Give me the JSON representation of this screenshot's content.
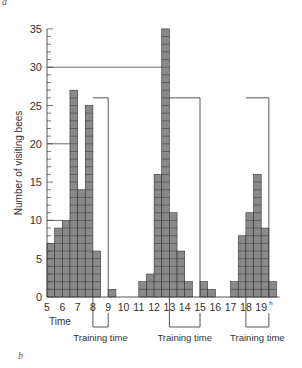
{
  "panel_labels": {
    "top": "a",
    "bottom": "b"
  },
  "chart_data": {
    "type": "bar",
    "title": "",
    "xlabel": "Time",
    "ylabel": "Number of visiting bees",
    "ylim": [
      0,
      35
    ],
    "yticks": [
      0,
      5,
      10,
      15,
      20,
      25,
      30,
      35
    ],
    "xticks": [
      "5",
      "6",
      "7",
      "8",
      "9",
      "10",
      "11",
      "12",
      "13",
      "14",
      "15",
      "16",
      "17",
      "18",
      "19h"
    ],
    "bin_width_hours": 0.5,
    "x": [
      5,
      5.5,
      6,
      6.5,
      7,
      7.5,
      8,
      9,
      11,
      11.5,
      12,
      12.5,
      13,
      13.5,
      14,
      15,
      15.5,
      17,
      17.5,
      18,
      18.5,
      19,
      19.5
    ],
    "values": [
      7,
      9,
      10,
      27,
      14,
      25,
      6,
      1,
      2,
      3,
      16,
      35,
      11,
      6,
      2,
      2,
      1,
      2,
      8,
      11,
      16,
      9,
      2
    ],
    "training_periods": [
      {
        "start": 8,
        "end": 9,
        "label": "Training time",
        "marker_height": 26
      },
      {
        "start": 13,
        "end": 15,
        "label": "Training time",
        "marker_height": 26
      },
      {
        "start": 18,
        "end": 19.5,
        "label": "Training time",
        "marker_height": 26
      }
    ],
    "reference_lines": [
      30,
      20,
      10
    ],
    "grid": false,
    "legend": null
  },
  "labels": {
    "xlabel": "Time",
    "ylabel": "Number of visiting bees",
    "training_1": "Training time",
    "training_2": "Training time",
    "training_3": "Training time"
  }
}
